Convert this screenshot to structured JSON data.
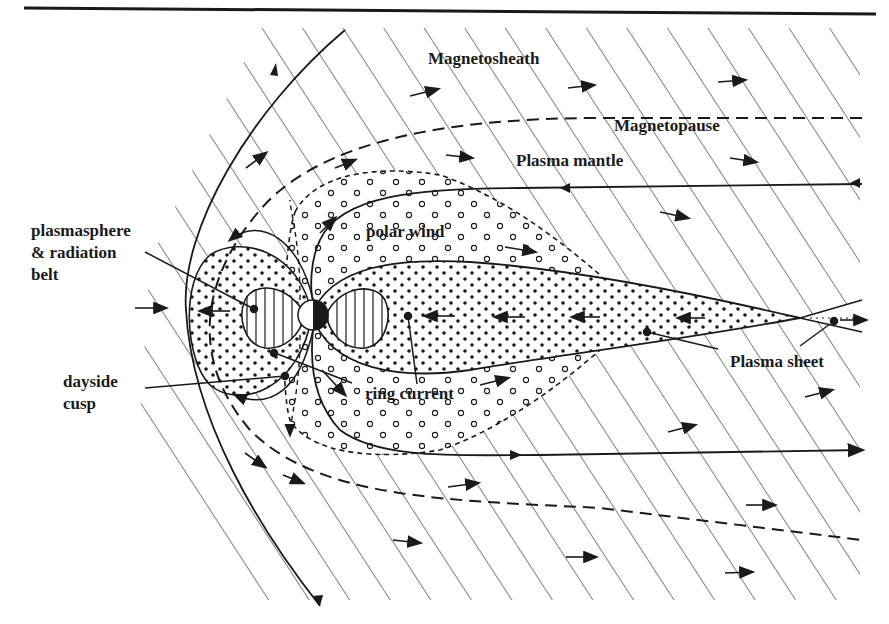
{
  "figure": {
    "labels": {
      "magnetosheath": "Magnetosheath",
      "magnetopause": "Magnetopause",
      "plasma_mantle": "Plasma mantle",
      "polar_wind": "polar wind",
      "plasmasphere_line1": "plasmasphere",
      "plasmasphere_line2": "& radiation",
      "plasmasphere_line3": "belt",
      "dayside_cusp_line1": "dayside",
      "dayside_cusp_line2": "cusp",
      "ring_current": "ring current",
      "plasma_sheet": "Plasma sheet"
    },
    "colors": {
      "ink": "#1a1a1a",
      "background": "#ffffff"
    }
  }
}
